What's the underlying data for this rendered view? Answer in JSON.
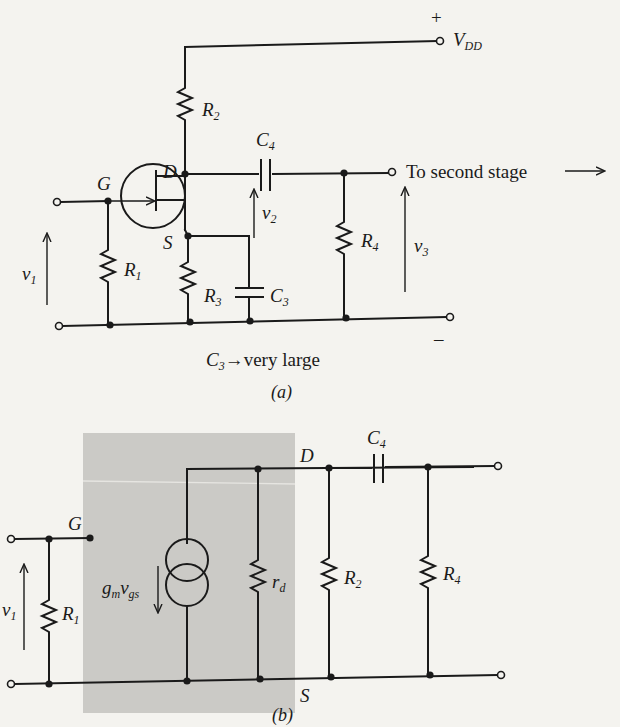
{
  "figure_a": {
    "caption": "(a)",
    "supply": {
      "plus": "+",
      "label": "V",
      "sub": "DD",
      "minus": "–"
    },
    "nodes": {
      "gate": "G",
      "drain": "D",
      "source": "S"
    },
    "components": {
      "R1": {
        "base": "R",
        "sub": "1"
      },
      "R2": {
        "base": "R",
        "sub": "2"
      },
      "R3": {
        "base": "R",
        "sub": "3"
      },
      "R4": {
        "base": "R",
        "sub": "4"
      },
      "C3": {
        "base": "C",
        "sub": "3"
      },
      "C4": {
        "base": "C",
        "sub": "4"
      }
    },
    "voltages": {
      "v1": {
        "base": "v",
        "sub": "1"
      },
      "v2": {
        "base": "v",
        "sub": "2"
      },
      "v3": {
        "base": "v",
        "sub": "3"
      }
    },
    "output_label": "To second stage",
    "note": {
      "base": "C",
      "sub": "3",
      "text": "→very large"
    }
  },
  "figure_b": {
    "caption": "(b)",
    "nodes": {
      "gate": "G",
      "drain": "D",
      "source": "S"
    },
    "components": {
      "R1": {
        "base": "R",
        "sub": "1"
      },
      "R2": {
        "base": "R",
        "sub": "2"
      },
      "R4": {
        "base": "R",
        "sub": "4"
      },
      "rd": {
        "base": "r",
        "sub": "d"
      },
      "C4": {
        "base": "C",
        "sub": "4"
      }
    },
    "source_label": {
      "g": "g",
      "m": "m",
      "v": "v",
      "gs": "gs"
    },
    "voltages": {
      "v1": {
        "base": "v",
        "sub": "1"
      }
    },
    "shade_color": "#c9c8c4"
  }
}
